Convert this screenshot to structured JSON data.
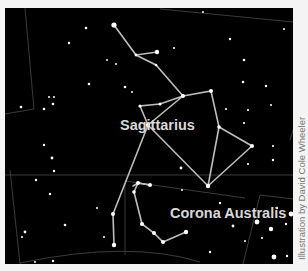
{
  "figure": {
    "background": "#000000",
    "line_color": "#b8b8b8",
    "boundary_color": "#555555",
    "constellations": [
      {
        "name": "Sagittarius",
        "label_x": 120,
        "label_y": 126
      },
      {
        "name": "Corona Australis",
        "label_x": 170,
        "label_y": 214
      }
    ],
    "credit": "Illustration by David Cole Wheeler"
  }
}
